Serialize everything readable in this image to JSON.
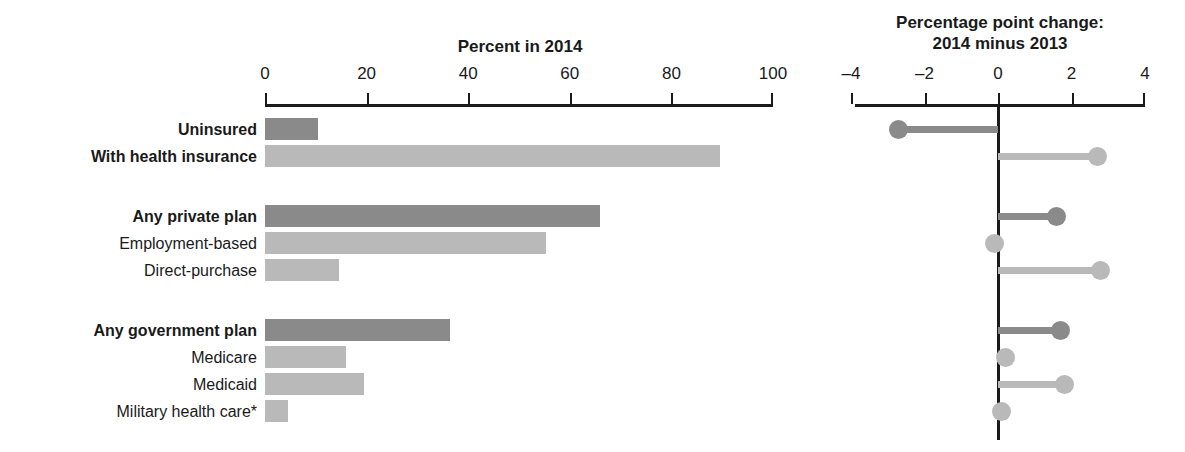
{
  "left_panel": {
    "title": "Percent in 2014",
    "axis": {
      "min": 0,
      "max": 100,
      "ticks": [
        0,
        20,
        40,
        60,
        80,
        100
      ],
      "tick_labels": [
        "0",
        "20",
        "40",
        "60",
        "80",
        "100"
      ]
    }
  },
  "right_panel": {
    "title_line1": "Percentage point change:",
    "title_line2": "2014 minus 2013",
    "axis": {
      "min": -4,
      "max": 4,
      "ticks": [
        -4,
        -2,
        0,
        2,
        4
      ],
      "tick_labels": [
        "–4",
        "–2",
        "0",
        "2",
        "4"
      ]
    }
  },
  "colors": {
    "dark_gray": "#8a8a8a",
    "mid_gray": "#a8a8a8",
    "light_gray": "#b9b9b9",
    "lighter_gray": "#c4c4c4",
    "axis": "#1a1a1a",
    "text": "#1a1a1a"
  },
  "chart_data": {
    "type": "bar",
    "xlabel": "",
    "ylabel": "",
    "categories": [
      "Uninsured",
      "With health insurance",
      "Any private plan",
      "Employment-based",
      "Direct-purchase",
      "Any government plan",
      "Medicare",
      "Medicaid",
      "Military health care*"
    ],
    "series": [
      {
        "name": "Percent in 2014",
        "values": [
          10.4,
          89.6,
          66.0,
          55.4,
          14.6,
          36.5,
          16.0,
          19.5,
          4.5
        ]
      },
      {
        "name": "Percentage point change: 2014 minus 2013",
        "values": [
          -2.7,
          2.7,
          1.6,
          -0.1,
          2.8,
          1.7,
          0.2,
          1.8,
          0.1
        ]
      }
    ],
    "xlim_percent": [
      0,
      100
    ],
    "xlim_change": [
      -4,
      4
    ],
    "grid": false,
    "legend": "none",
    "footnote_marker": "*"
  },
  "rows": [
    {
      "label": "Uninsured",
      "bold": true,
      "percent": 10.4,
      "change": -2.7,
      "shade": "dark",
      "group": 0
    },
    {
      "label": "With health insurance",
      "bold": true,
      "percent": 89.6,
      "change": 2.7,
      "shade": "light",
      "group": 0
    },
    {
      "label": "Any private plan",
      "bold": true,
      "percent": 66.0,
      "change": 1.6,
      "shade": "dark",
      "group": 1
    },
    {
      "label": "Employment-based",
      "bold": false,
      "percent": 55.4,
      "change": -0.1,
      "shade": "light",
      "group": 1
    },
    {
      "label": "Direct-purchase",
      "bold": false,
      "percent": 14.6,
      "change": 2.8,
      "shade": "light",
      "group": 1
    },
    {
      "label": "Any government plan",
      "bold": true,
      "percent": 36.5,
      "change": 1.7,
      "shade": "dark",
      "group": 2
    },
    {
      "label": "Medicare",
      "bold": false,
      "percent": 16.0,
      "change": 0.2,
      "shade": "light",
      "group": 2
    },
    {
      "label": "Medicaid",
      "bold": false,
      "percent": 19.5,
      "change": 1.8,
      "shade": "light",
      "group": 2
    },
    {
      "label": "Military health care*",
      "bold": false,
      "percent": 4.5,
      "change": 0.1,
      "shade": "light",
      "group": 2
    }
  ]
}
